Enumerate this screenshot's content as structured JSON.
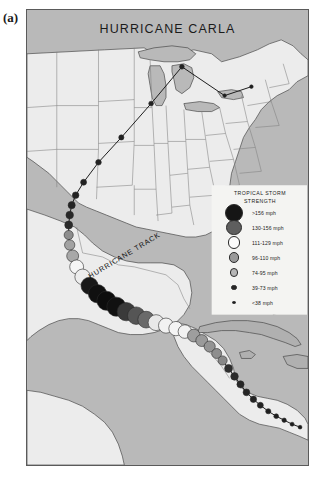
{
  "panel_label": "(a)",
  "map": {
    "title": "HURRICANE CARLA",
    "track_label": "HURRICANE TRACK",
    "ocean_color": "#b9b9b9",
    "land_color": "#ececec",
    "lake_color": "#b9b9b9",
    "border_color": "#555555"
  },
  "legend": {
    "title_line1": "TROPICAL  STORM",
    "title_line2": "STRENGTH",
    "panel_color": "#f4f4f2",
    "items": [
      {
        "label": ">156 mph",
        "color": "#151515",
        "radius": 9.0
      },
      {
        "label": "130-156 mph",
        "color": "#5e5e5e",
        "radius": 7.6
      },
      {
        "label": "111-129 mph",
        "color": "#fbfbfb",
        "radius": 6.4
      },
      {
        "label": "96-110 mph",
        "color": "#9a9a9a",
        "radius": 5.3
      },
      {
        "label": "74-95 mph",
        "color": "#b6b6b6",
        "radius": 4.2
      },
      {
        "label": "39-73 mph",
        "color": "#262626",
        "radius": 2.8
      },
      {
        "label": "<38 mph",
        "color": "#1e1e1e",
        "radius": 1.7
      }
    ]
  },
  "chart_data": {
    "type": "scatter",
    "title": "HURRICANE CARLA",
    "xlabel": "",
    "ylabel": "",
    "annotations": [
      "HURRICANE TRACK"
    ],
    "legend_position": "right",
    "categories": [
      ">156 mph",
      "130-156 mph",
      "111-129 mph",
      "96-110 mph",
      "74-95 mph",
      "39-73 mph",
      "<38 mph"
    ],
    "track_points": [
      {
        "x": 226,
        "y": 77,
        "strength": "<38 mph",
        "r": 1.8,
        "color": "#1e1e1e"
      },
      {
        "x": 199,
        "y": 86,
        "strength": "<38 mph",
        "r": 1.8,
        "color": "#1e1e1e"
      },
      {
        "x": 156,
        "y": 57,
        "strength": "39-73 mph",
        "r": 2.4,
        "color": "#222222"
      },
      {
        "x": 125,
        "y": 94,
        "strength": "39-73 mph",
        "r": 2.4,
        "color": "#222222"
      },
      {
        "x": 95,
        "y": 128,
        "strength": "39-73 mph",
        "r": 2.6,
        "color": "#222222"
      },
      {
        "x": 72,
        "y": 153,
        "strength": "39-73 mph",
        "r": 2.8,
        "color": "#222222"
      },
      {
        "x": 57,
        "y": 173,
        "strength": "39-73 mph",
        "r": 3.0,
        "color": "#222222"
      },
      {
        "x": 49,
        "y": 186,
        "strength": "39-73 mph",
        "r": 3.3,
        "color": "#232323"
      },
      {
        "x": 45,
        "y": 196,
        "strength": "39-73 mph",
        "r": 3.6,
        "color": "#242424"
      },
      {
        "x": 43,
        "y": 206,
        "strength": "39-73 mph",
        "r": 3.8,
        "color": "#272727"
      },
      {
        "x": 42,
        "y": 216,
        "strength": "39-73 mph",
        "r": 4.0,
        "color": "#2b2b2b"
      },
      {
        "x": 42,
        "y": 226,
        "strength": "74-95 mph",
        "r": 4.6,
        "color": "#8d8d8d"
      },
      {
        "x": 43,
        "y": 236,
        "strength": "74-95 mph",
        "r": 5.2,
        "color": "#a2a2a2"
      },
      {
        "x": 46,
        "y": 247,
        "strength": "96-110 mph",
        "r": 6.0,
        "color": "#a8a8a8"
      },
      {
        "x": 50,
        "y": 258,
        "strength": "111-129 mph",
        "r": 7.0,
        "color": "#f6f6f6"
      },
      {
        "x": 56,
        "y": 268,
        "strength": "111-129 mph",
        "r": 7.8,
        "color": "#ededed"
      },
      {
        "x": 63,
        "y": 277,
        "strength": ">156 mph",
        "r": 8.6,
        "color": "#181818"
      },
      {
        "x": 71,
        "y": 285,
        "strength": ">156 mph",
        "r": 9.2,
        "color": "#101010"
      },
      {
        "x": 80,
        "y": 292,
        "strength": ">156 mph",
        "r": 9.6,
        "color": "#0d0d0d"
      },
      {
        "x": 90,
        "y": 298,
        "strength": ">156 mph",
        "r": 9.6,
        "color": "#111111"
      },
      {
        "x": 100,
        "y": 303,
        "strength": "130-156 mph",
        "r": 9.2,
        "color": "#3a3a3a"
      },
      {
        "x": 110,
        "y": 307,
        "strength": "130-156 mph",
        "r": 8.8,
        "color": "#555555"
      },
      {
        "x": 120,
        "y": 311,
        "strength": "130-156 mph",
        "r": 8.4,
        "color": "#6a6a6a"
      },
      {
        "x": 130,
        "y": 314,
        "strength": "111-129 mph",
        "r": 8.0,
        "color": "#e8e8e8"
      },
      {
        "x": 140,
        "y": 317,
        "strength": "111-129 mph",
        "r": 7.6,
        "color": "#f2f2f2"
      },
      {
        "x": 150,
        "y": 320,
        "strength": "111-129 mph",
        "r": 7.2,
        "color": "#f4f4f4"
      },
      {
        "x": 159,
        "y": 323,
        "strength": "111-129 mph",
        "r": 6.8,
        "color": "#f2f2f2"
      },
      {
        "x": 168,
        "y": 327,
        "strength": "96-110 mph",
        "r": 6.4,
        "color": "#9e9e9e"
      },
      {
        "x": 176,
        "y": 332,
        "strength": "96-110 mph",
        "r": 6.0,
        "color": "#9a9a9a"
      },
      {
        "x": 184,
        "y": 338,
        "strength": "96-110 mph",
        "r": 5.6,
        "color": "#949494"
      },
      {
        "x": 191,
        "y": 345,
        "strength": "74-95 mph",
        "r": 5.0,
        "color": "#8e8e8e"
      },
      {
        "x": 197,
        "y": 352,
        "strength": "74-95 mph",
        "r": 4.6,
        "color": "#888888"
      },
      {
        "x": 203,
        "y": 360,
        "strength": "39-73 mph",
        "r": 4.0,
        "color": "#2e2e2e"
      },
      {
        "x": 209,
        "y": 368,
        "strength": "39-73 mph",
        "r": 3.8,
        "color": "#2a2a2a"
      },
      {
        "x": 215,
        "y": 376,
        "strength": "39-73 mph",
        "r": 3.6,
        "color": "#272727"
      },
      {
        "x": 221,
        "y": 384,
        "strength": "39-73 mph",
        "r": 3.4,
        "color": "#252525"
      },
      {
        "x": 228,
        "y": 391,
        "strength": "39-73 mph",
        "r": 3.2,
        "color": "#232323"
      },
      {
        "x": 235,
        "y": 397,
        "strength": "39-73 mph",
        "r": 3.0,
        "color": "#222222"
      },
      {
        "x": 243,
        "y": 403,
        "strength": "<38 mph",
        "r": 2.6,
        "color": "#1f1f1f"
      },
      {
        "x": 251,
        "y": 408,
        "strength": "<38 mph",
        "r": 2.4,
        "color": "#1e1e1e"
      },
      {
        "x": 259,
        "y": 412,
        "strength": "<38 mph",
        "r": 2.2,
        "color": "#1e1e1e"
      },
      {
        "x": 267,
        "y": 416,
        "strength": "<38 mph",
        "r": 2.0,
        "color": "#1d1d1d"
      },
      {
        "x": 275,
        "y": 419,
        "strength": "<38 mph",
        "r": 1.9,
        "color": "#1d1d1d"
      }
    ]
  }
}
